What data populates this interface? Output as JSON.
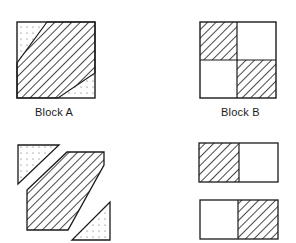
{
  "figure": {
    "colors": {
      "line": "#1a1a1a",
      "background": "#ffffff",
      "dot": "#555555"
    },
    "blocks": [
      {
        "id": "block-a",
        "label": "Block A",
        "composition": "square with central diagonal hatched band and two dotted corner triangles",
        "exploded_pieces": [
          "dotted top-left triangle",
          "hatched hexagon band",
          "dotted bottom-right triangle"
        ]
      },
      {
        "id": "block-b",
        "label": "Block B",
        "composition": "four-patch: hatched top-left and bottom-right, plain top-right and bottom-left",
        "exploded_pieces": [
          "top strip: hatched left + plain right",
          "bottom strip: plain left + hatched right"
        ]
      }
    ]
  }
}
